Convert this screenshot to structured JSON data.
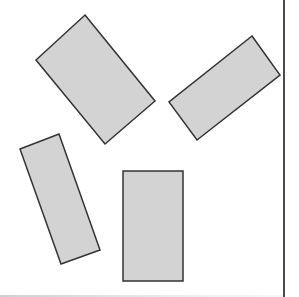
{
  "canvas": {
    "width": 299,
    "height": 297,
    "background": "#ffffff"
  },
  "style": {
    "shape_fill": "#d3d3d3",
    "shape_stroke": "#333333",
    "shape_stroke_width": 1.5,
    "right_border_color": "#4a4a4a"
  },
  "shapes": [
    {
      "id": "rect-1",
      "type": "rotated-rectangle",
      "points": [
        [
          85,
          15
        ],
        [
          155,
          101
        ],
        [
          105,
          144
        ],
        [
          36,
          60
        ]
      ]
    },
    {
      "id": "rect-2",
      "type": "rotated-rectangle",
      "points": [
        [
          252,
          36
        ],
        [
          280,
          75
        ],
        [
          197,
          140
        ],
        [
          169,
          102
        ]
      ]
    },
    {
      "id": "rect-3",
      "type": "rotated-rectangle",
      "points": [
        [
          20,
          149
        ],
        [
          59,
          134
        ],
        [
          100,
          250
        ],
        [
          61,
          264
        ]
      ]
    },
    {
      "id": "rect-4",
      "type": "rectangle",
      "points": [
        [
          123,
          171
        ],
        [
          183,
          171
        ],
        [
          183,
          281
        ],
        [
          123,
          281
        ]
      ]
    }
  ]
}
